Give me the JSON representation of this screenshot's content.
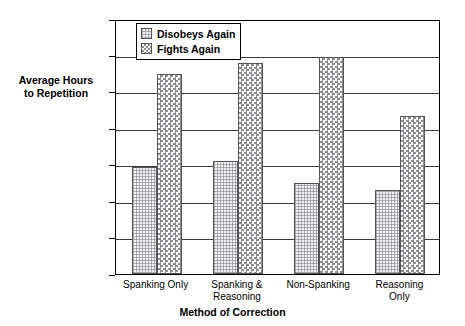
{
  "chart_data": {
    "type": "bar",
    "title": "",
    "xlabel": "Method of Correction",
    "ylabel": "Average Hours to Repetition",
    "ylabel_lines": [
      "Average Hours",
      "to Repetition"
    ],
    "categories": [
      "Spanking Only",
      "Spanking & Reasoning",
      "Non-Spanking",
      "Reasoning Only"
    ],
    "category_lines": [
      [
        "Spanking Only"
      ],
      [
        "Spanking &",
        "Reasoning"
      ],
      [
        "Non-Spanking"
      ],
      [
        "Reasoning",
        "Only"
      ]
    ],
    "series": [
      {
        "name": "Disobeys Again",
        "values": [
          2.95,
          3.1,
          2.5,
          2.3
        ]
      },
      {
        "name": "Fights Again",
        "values": [
          5.5,
          5.8,
          5.95,
          4.35
        ]
      }
    ],
    "ylim": [
      0,
      7
    ],
    "ytick_labels": [
      "0",
      "1",
      "2",
      "3",
      "4",
      "5",
      "6",
      "7"
    ],
    "ytick_values": [
      0,
      1,
      2,
      3,
      4,
      5,
      6,
      7
    ],
    "grid": true,
    "grid_axis": "y",
    "legend_position": "top-left-inside",
    "legend_entries": [
      "Disobeys Again",
      "Fights Again"
    ],
    "colors": {
      "series_0_fill": "#f2f2f2",
      "series_1_fill": "#ffffff",
      "pattern": "#8d8d96",
      "axis": "#000000",
      "gridline": "#3a3a3a",
      "background": "#ffffff"
    }
  }
}
